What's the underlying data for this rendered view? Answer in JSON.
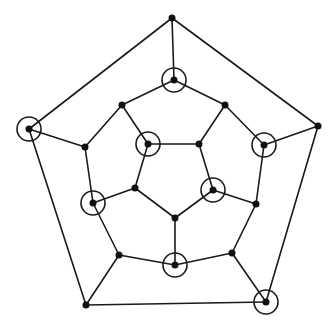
{
  "diagram": {
    "type": "graph",
    "title": "",
    "colors": {
      "line": "#1a1a1a",
      "vertex": "#111111",
      "background": "#ffffff"
    },
    "vertex_radius": 3.5,
    "circle_radius": 12,
    "vertices": [
      {
        "id": 0,
        "x": 172,
        "y": 18,
        "circled": false
      },
      {
        "id": 1,
        "x": 29,
        "y": 129,
        "circled": true
      },
      {
        "id": 2,
        "x": 318,
        "y": 126,
        "circled": false
      },
      {
        "id": 3,
        "x": 86,
        "y": 305,
        "circled": false
      },
      {
        "id": 4,
        "x": 266,
        "y": 302,
        "circled": true
      },
      {
        "id": 5,
        "x": 174,
        "y": 80,
        "circled": true
      },
      {
        "id": 6,
        "x": 122,
        "y": 105,
        "circled": false
      },
      {
        "id": 7,
        "x": 225,
        "y": 105,
        "circled": false
      },
      {
        "id": 8,
        "x": 85,
        "y": 147,
        "circled": false
      },
      {
        "id": 9,
        "x": 264,
        "y": 145,
        "circled": true
      },
      {
        "id": 10,
        "x": 93,
        "y": 203,
        "circled": true
      },
      {
        "id": 11,
        "x": 256,
        "y": 204,
        "circled": false
      },
      {
        "id": 12,
        "x": 119,
        "y": 255,
        "circled": false
      },
      {
        "id": 13,
        "x": 232,
        "y": 253,
        "circled": false
      },
      {
        "id": 14,
        "x": 175,
        "y": 265,
        "circled": true
      },
      {
        "id": 15,
        "x": 148,
        "y": 144,
        "circled": true
      },
      {
        "id": 16,
        "x": 199,
        "y": 144,
        "circled": false
      },
      {
        "id": 17,
        "x": 135,
        "y": 188,
        "circled": false
      },
      {
        "id": 18,
        "x": 213,
        "y": 190,
        "circled": true
      },
      {
        "id": 19,
        "x": 175,
        "y": 218,
        "circled": false
      }
    ],
    "edges": [
      [
        0,
        1
      ],
      [
        0,
        2
      ],
      [
        1,
        3
      ],
      [
        2,
        4
      ],
      [
        3,
        4
      ],
      [
        0,
        5
      ],
      [
        1,
        8
      ],
      [
        2,
        9
      ],
      [
        3,
        12
      ],
      [
        4,
        13
      ],
      [
        5,
        6
      ],
      [
        5,
        7
      ],
      [
        6,
        8
      ],
      [
        7,
        9
      ],
      [
        8,
        10
      ],
      [
        9,
        11
      ],
      [
        10,
        12
      ],
      [
        11,
        13
      ],
      [
        12,
        14
      ],
      [
        13,
        14
      ],
      [
        6,
        15
      ],
      [
        7,
        16
      ],
      [
        10,
        17
      ],
      [
        11,
        18
      ],
      [
        14,
        19
      ],
      [
        15,
        16
      ],
      [
        16,
        18
      ],
      [
        18,
        19
      ],
      [
        19,
        17
      ],
      [
        17,
        15
      ]
    ]
  }
}
